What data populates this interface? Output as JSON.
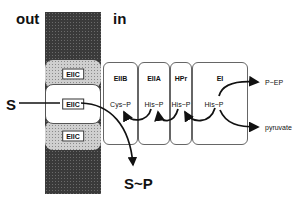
{
  "labels": {
    "out": "out",
    "in": "in",
    "substrate": "S",
    "product": "S~P"
  },
  "membrane": {
    "upper_protein": "EIIC",
    "middle_protein": "EIIC",
    "lower_protein": "EIIC"
  },
  "boxes": [
    {
      "title": "EIIB",
      "site": "Cys~P"
    },
    {
      "title": "EIIA",
      "site": "His~P"
    },
    {
      "title": "HPr",
      "site": "His~P"
    },
    {
      "title": "EI",
      "site": "His~P"
    }
  ],
  "outputs": {
    "pep": "P~EP",
    "pyruvate": "pyruvate"
  }
}
